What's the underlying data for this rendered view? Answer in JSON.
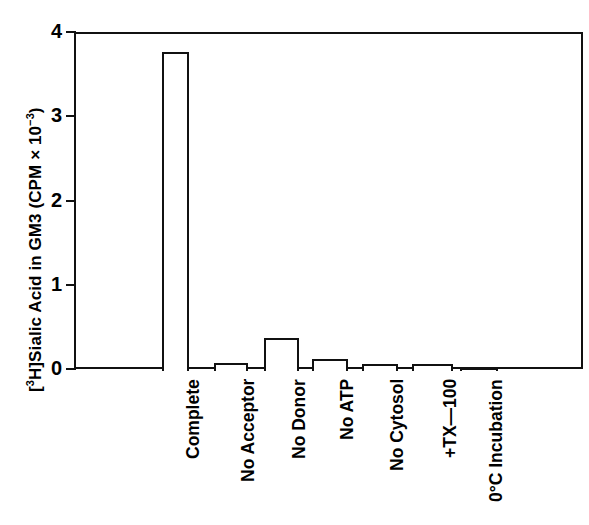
{
  "chart_data": {
    "type": "bar",
    "title": "",
    "xlabel": "",
    "ylabel": "[3H]Sialic Acid in GM3 (CPM × 10-3)",
    "ylabel_parts": {
      "prefix": "[",
      "iso_sup": "3",
      "iso": "H]Sialic Acid in GM3 (CPM × 10",
      "exp_sup": "−3",
      "suffix": ")"
    },
    "categories": [
      "Complete",
      "No Acceptor",
      "No Donor",
      "No ATP",
      "No Cytosol",
      "+TX—100",
      "0°C Incubation"
    ],
    "values": [
      3.79,
      0.09,
      0.39,
      0.14,
      0.08,
      0.08,
      0.04
    ],
    "ylim": [
      0,
      4
    ],
    "yticks": [
      0,
      1,
      2,
      3,
      4
    ],
    "ytick_labels": [
      "0",
      "1",
      "2",
      "3",
      "4"
    ],
    "grid": false,
    "legend": false,
    "bar_fill": "#ffffff",
    "bar_edge": "#111111",
    "axis_color": "#111111",
    "background": "#ffffff"
  }
}
